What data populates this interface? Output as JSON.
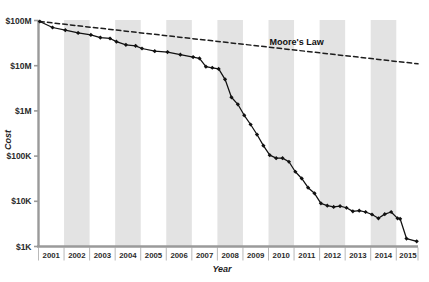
{
  "chart_data": {
    "type": "line",
    "title": "",
    "subtitle": "",
    "xlabel": "Year",
    "ylabel": "Cost",
    "yscale": "log",
    "ylim": [
      1000,
      100000000
    ],
    "xlim": [
      2001.0,
      2015.85
    ],
    "grid": false,
    "legend_position": "none",
    "ytick_labels": [
      "$100M",
      "$10M",
      "$1M",
      "$100K",
      "$10K",
      "$1K"
    ],
    "ytick_values": [
      100000000,
      10000000,
      1000000,
      100000,
      10000,
      1000
    ],
    "xtick_labels": [
      "2001",
      "2002",
      "2003",
      "2004",
      "2005",
      "2006",
      "2007",
      "2008",
      "2009",
      "2010",
      "2011",
      "2012",
      "2013",
      "2014",
      "2015"
    ],
    "xtick_values": [
      2001,
      2002,
      2003,
      2004,
      2005,
      2006,
      2007,
      2008,
      2009,
      2010,
      2011,
      2012,
      2013,
      2014,
      2015
    ],
    "banded_years": [
      2002,
      2004,
      2006,
      2008,
      2010,
      2012,
      2014
    ],
    "band_color": "#e3e3e3",
    "series": [
      {
        "name": "Cost per Genome",
        "marker": "diamond",
        "color": "#111111",
        "linestyle": "solid",
        "points": [
          {
            "x": 2001.05,
            "y": 95000000
          },
          {
            "x": 2001.55,
            "y": 70000000
          },
          {
            "x": 2002.05,
            "y": 61000000
          },
          {
            "x": 2002.55,
            "y": 53000000
          },
          {
            "x": 2003.05,
            "y": 48000000
          },
          {
            "x": 2003.42,
            "y": 42000000
          },
          {
            "x": 2003.8,
            "y": 40000000
          },
          {
            "x": 2004.05,
            "y": 34000000
          },
          {
            "x": 2004.42,
            "y": 29000000
          },
          {
            "x": 2004.8,
            "y": 27500000
          },
          {
            "x": 2005.05,
            "y": 24000000
          },
          {
            "x": 2005.55,
            "y": 21000000
          },
          {
            "x": 2006.05,
            "y": 20000000
          },
          {
            "x": 2006.55,
            "y": 17500000
          },
          {
            "x": 2007.05,
            "y": 15500000
          },
          {
            "x": 2007.3,
            "y": 14500000
          },
          {
            "x": 2007.55,
            "y": 9500000
          },
          {
            "x": 2007.8,
            "y": 9000000
          },
          {
            "x": 2008.05,
            "y": 8500000
          },
          {
            "x": 2008.3,
            "y": 5000000
          },
          {
            "x": 2008.55,
            "y": 2000000
          },
          {
            "x": 2008.8,
            "y": 1400000
          },
          {
            "x": 2009.05,
            "y": 800000
          },
          {
            "x": 2009.3,
            "y": 500000
          },
          {
            "x": 2009.55,
            "y": 300000
          },
          {
            "x": 2009.8,
            "y": 170000
          },
          {
            "x": 2010.05,
            "y": 105000
          },
          {
            "x": 2010.3,
            "y": 90000
          },
          {
            "x": 2010.55,
            "y": 90000
          },
          {
            "x": 2010.8,
            "y": 75000
          },
          {
            "x": 2011.05,
            "y": 45000
          },
          {
            "x": 2011.3,
            "y": 32000
          },
          {
            "x": 2011.55,
            "y": 20000
          },
          {
            "x": 2011.8,
            "y": 15000
          },
          {
            "x": 2012.05,
            "y": 9000
          },
          {
            "x": 2012.3,
            "y": 8000
          },
          {
            "x": 2012.55,
            "y": 7500
          },
          {
            "x": 2012.8,
            "y": 7800
          },
          {
            "x": 2013.05,
            "y": 7200
          },
          {
            "x": 2013.3,
            "y": 6000
          },
          {
            "x": 2013.55,
            "y": 6200
          },
          {
            "x": 2013.8,
            "y": 5800
          },
          {
            "x": 2014.05,
            "y": 5100
          },
          {
            "x": 2014.3,
            "y": 4200
          },
          {
            "x": 2014.55,
            "y": 5200
          },
          {
            "x": 2014.8,
            "y": 5800
          },
          {
            "x": 2015.05,
            "y": 4200
          },
          {
            "x": 2015.15,
            "y": 4100
          },
          {
            "x": 2015.4,
            "y": 1500
          },
          {
            "x": 2015.8,
            "y": 1300
          }
        ]
      },
      {
        "name": "Moore's Law",
        "marker": "none",
        "color": "#1d1d1d",
        "linestyle": "dashed",
        "points": [
          {
            "x": 2001.05,
            "y": 95000000
          },
          {
            "x": 2015.85,
            "y": 11000000
          }
        ]
      }
    ],
    "annotations": [
      {
        "text": "Moore's Law",
        "x": 2011.1,
        "y": 28000000
      }
    ]
  }
}
